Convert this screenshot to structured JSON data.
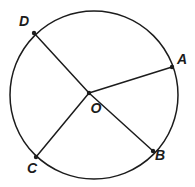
{
  "figure": {
    "kind": "geometry-circle-diagram",
    "background": "#ffffff",
    "stroke_color": "#1c1c1c",
    "label_color": "#1c1c1c",
    "circle": {
      "cx": 94,
      "cy": 95,
      "r": 84,
      "stroke_width": 1.5
    },
    "center": {
      "label": "O",
      "x": 89,
      "y": 93,
      "label_x": 96,
      "label_y": 108
    },
    "points": [
      {
        "label": "D",
        "x": 34,
        "y": 33,
        "label_x": 24,
        "label_y": 21
      },
      {
        "label": "A",
        "x": 172,
        "y": 67,
        "label_x": 182,
        "label_y": 59
      },
      {
        "label": "B",
        "x": 153,
        "y": 151,
        "label_x": 160,
        "label_y": 155
      },
      {
        "label": "C",
        "x": 36,
        "y": 157,
        "label_x": 32,
        "label_y": 168
      }
    ],
    "segments": [
      {
        "from": "O",
        "to": "D"
      },
      {
        "from": "O",
        "to": "A"
      },
      {
        "from": "O",
        "to": "B"
      },
      {
        "from": "O",
        "to": "C"
      }
    ],
    "segment_stroke_width": 1.5,
    "dot_radius": 2.2,
    "label_font_size": 14
  }
}
